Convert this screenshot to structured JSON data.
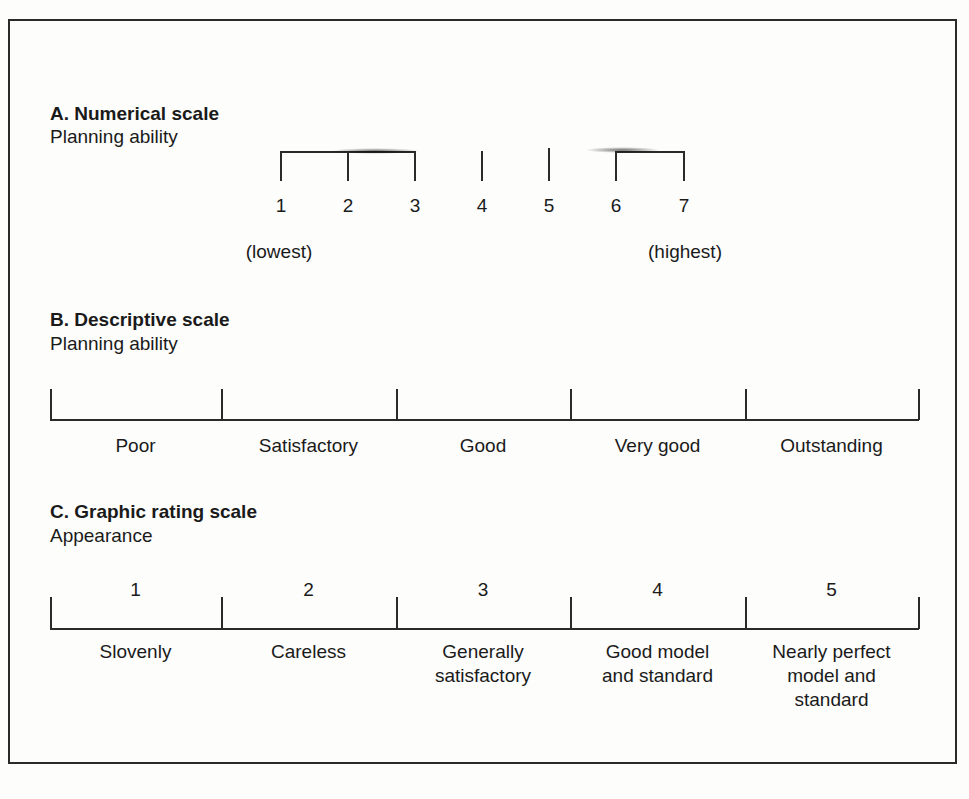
{
  "sectionA": {
    "title": "A. Numerical scale",
    "subtitle": "Planning ability",
    "ticks": [
      "1",
      "2",
      "3",
      "4",
      "5",
      "6",
      "7"
    ],
    "low_label": "(lowest)",
    "high_label": "(highest)"
  },
  "sectionB": {
    "title": "B. Descriptive scale",
    "subtitle": "Planning ability",
    "labels": [
      "Poor",
      "Satisfactory",
      "Good",
      "Very good",
      "Outstanding"
    ]
  },
  "sectionC": {
    "title": "C. Graphic rating scale",
    "subtitle": "Appearance",
    "numbers": [
      "1",
      "2",
      "3",
      "4",
      "5"
    ],
    "labels": [
      [
        "Slovenly"
      ],
      [
        "Careless"
      ],
      [
        "Generally",
        "satisfactory"
      ],
      [
        "Good model",
        "and standard"
      ],
      [
        "Nearly perfect",
        "model and",
        "standard"
      ]
    ]
  }
}
